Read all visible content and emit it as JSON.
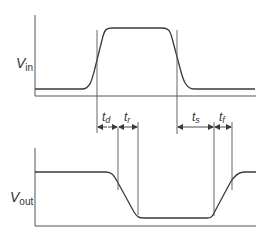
{
  "diagram": {
    "colors": {
      "line": "#3a3a3a",
      "axis": "#555555",
      "text": "#333333",
      "background": "#ffffff"
    },
    "input_waveform": {
      "label_main": "V",
      "label_sub": "in"
    },
    "output_waveform": {
      "label_main": "V",
      "label_sub": "out"
    },
    "intervals": [
      {
        "main": "t",
        "sub": "d",
        "name": "delay-time"
      },
      {
        "main": "t",
        "sub": "r",
        "name": "rise-time"
      },
      {
        "main": "t",
        "sub": "s",
        "name": "storage-time"
      },
      {
        "main": "t",
        "sub": "f",
        "name": "fall-time"
      }
    ]
  }
}
